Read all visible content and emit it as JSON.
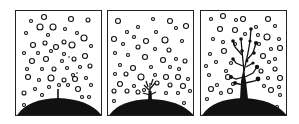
{
  "figure": {
    "type": "three-panel sequence illustration",
    "panels": [
      {
        "index": 1,
        "stage": "sprout",
        "description": "Small thin stem emerging from a dark mound, surrounded by many small hollow circles"
      },
      {
        "index": 2,
        "stage": "small-plant",
        "description": "Short branching plant on the mound, surrounded by hollow circles"
      },
      {
        "index": 3,
        "stage": "tall-plant",
        "description": "Tall branching plant with dark filled nodes on the mound, surrounded by hollow circles"
      }
    ],
    "colors": {
      "ink": "#111111",
      "background": "#ffffff",
      "border": "#222222"
    }
  }
}
